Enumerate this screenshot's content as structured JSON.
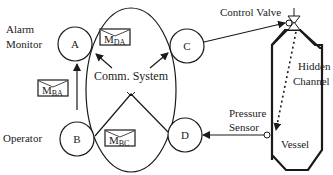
{
  "labels": {
    "alarm_monitor_line1": "Alarm",
    "alarm_monitor_line2": "Monitor",
    "operator": "Operator",
    "comm_system": "Comm. System",
    "control_valve": "Control Valve",
    "hidden_line1": "Hidden",
    "hidden_line2": "Channel",
    "pressure_line1": "Pressure",
    "pressure_line2": "Sensor",
    "vessel": "Vessel"
  },
  "nodes": {
    "A": "A",
    "B": "B",
    "C": "C",
    "D": "D"
  },
  "messages": {
    "m_da": {
      "main": "M",
      "sub": "DA"
    },
    "m_ba": {
      "main": "M",
      "sub": "BA"
    },
    "m_bc": {
      "main": "M",
      "sub": "BC"
    }
  },
  "colors": {
    "stroke": "#1a1a1a",
    "background": "#ffffff"
  }
}
